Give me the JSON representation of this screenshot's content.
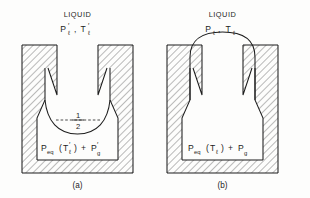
{
  "figure": {
    "background_color": "#fdfdfc",
    "line_color": "#1d1d1d",
    "hatch_color": "#4a4a4a"
  },
  "panels": [
    {
      "id": "a",
      "caption": "(a)",
      "liquid_label": "LIQUID",
      "state": {
        "pressure_symbol": "P",
        "pressure_prime": "′",
        "pressure_subscript": "ℓ",
        "separator": ",",
        "temperature_symbol": "T",
        "temperature_prime": "′",
        "temperature_subscript": "ℓ"
      },
      "cavity_pressure": {
        "lead_symbol": "P",
        "lead_subscript": "eq",
        "arg_open": "(",
        "arg_symbol": "T",
        "arg_prime": "′",
        "arg_subscript": "ℓ",
        "arg_close": ")",
        "operator": "+",
        "gas_symbol": "P",
        "gas_prime": "′",
        "gas_subscript": "g"
      },
      "annotation": {
        "numerator": "1",
        "denominator": "2",
        "style": "dashed-chord-fraction"
      },
      "meniscus_shape": "concave-depressed"
    },
    {
      "id": "b",
      "caption": "(b)",
      "liquid_label": "LIQUID",
      "state": {
        "pressure_symbol": "P",
        "pressure_prime": "",
        "pressure_subscript": "ℓ",
        "separator": ",",
        "temperature_symbol": "T",
        "temperature_prime": "",
        "temperature_subscript": "ℓ"
      },
      "cavity_pressure": {
        "lead_symbol": "P",
        "lead_subscript": "eq",
        "arg_open": "(",
        "arg_symbol": "T",
        "arg_prime": "",
        "arg_subscript": "ℓ",
        "arg_close": ")",
        "operator": "+",
        "gas_symbol": "P",
        "gas_prime": "",
        "gas_subscript": "g"
      },
      "annotation": null,
      "meniscus_shape": "convex-bulging"
    }
  ]
}
